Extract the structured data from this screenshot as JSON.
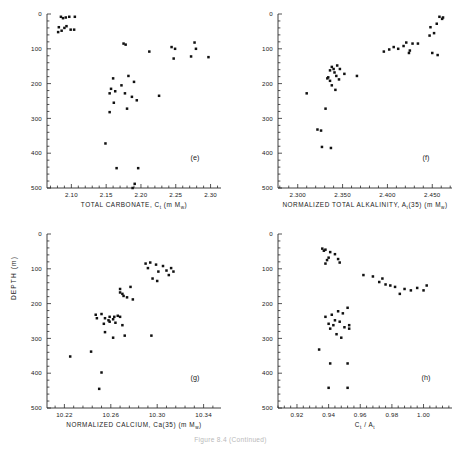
{
  "figure": {
    "caption": "Figure 8.4 (Continued)",
    "y_axis_label": "DEPTH (m)",
    "y_ticks": [
      0,
      100,
      200,
      300,
      400,
      500
    ],
    "y_range": [
      0,
      500
    ],
    "y_inverted": true,
    "marker": "filled-square",
    "marker_color": "#111111",
    "axis_color": "#2a2a2a",
    "background": "#ffffff"
  },
  "chart_data": [
    {
      "type": "scatter",
      "panel": "(e)",
      "title": "",
      "xlabel": "TOTAL CARBONATE, C",
      "xlabel_sub": "t",
      "xlabel_units": "(m M",
      "xlabel_units_sub": "w",
      "xlabel_units_end": ")",
      "xlabel_full": "TOTAL CARBONATE, Ct (m Mw)",
      "ylabel": "DEPTH (m)",
      "xlim": [
        2.065,
        2.315
      ],
      "ylim": [
        0,
        500
      ],
      "xticks": [
        2.1,
        2.15,
        2.2,
        2.25,
        2.3
      ],
      "xticklabels": [
        "2.10",
        "2.15",
        "2.20",
        "2.25",
        "2.30"
      ],
      "yticks": [
        0,
        100,
        200,
        300,
        400,
        500
      ],
      "grid": false,
      "x": [
        2.085,
        2.088,
        2.092,
        2.097,
        2.105,
        2.082,
        2.09,
        2.093,
        2.099,
        2.086,
        2.081,
        2.104,
        2.175,
        2.178,
        2.212,
        2.244,
        2.277,
        2.249,
        2.279,
        2.247,
        2.272,
        2.297,
        2.16,
        2.157,
        2.155,
        2.163,
        2.182,
        2.19,
        2.172,
        2.177,
        2.226,
        2.161,
        2.187,
        2.194,
        2.18,
        2.155,
        2.149,
        2.165,
        2.196,
        2.191,
        2.188
      ],
      "y": [
        8,
        12,
        10,
        8,
        8,
        38,
        40,
        35,
        45,
        48,
        52,
        45,
        85,
        88,
        108,
        95,
        82,
        100,
        100,
        128,
        122,
        124,
        185,
        215,
        228,
        222,
        178,
        195,
        205,
        228,
        235,
        255,
        238,
        248,
        272,
        282,
        372,
        443,
        443,
        488,
        500
      ],
      "n_points": 41
    },
    {
      "type": "scatter",
      "panel": "(f)",
      "title": "",
      "xlabel_full": "NORMALIZED TOTAL ALKALINITY, At(35) (m Mw)",
      "ylabel": "DEPTH (m)",
      "xlim": [
        2.278,
        2.472
      ],
      "ylim": [
        0,
        500
      ],
      "xticks": [
        2.3,
        2.35,
        2.4,
        2.45
      ],
      "xticklabels": [
        "2.300",
        "2.350",
        "2.400",
        "2.450"
      ],
      "yticks": [
        0,
        100,
        200,
        300,
        400,
        500
      ],
      "grid": false,
      "x": [
        2.458,
        2.462,
        2.461,
        2.455,
        2.448,
        2.452,
        2.447,
        2.421,
        2.428,
        2.434,
        2.418,
        2.407,
        2.412,
        2.402,
        2.425,
        2.424,
        2.396,
        2.45,
        2.456,
        2.344,
        2.338,
        2.34,
        2.336,
        2.347,
        2.341,
        2.343,
        2.334,
        2.333,
        2.336,
        2.346,
        2.352,
        2.338,
        2.342,
        2.366,
        2.31,
        2.331,
        2.322,
        2.326,
        2.327,
        2.337
      ],
      "y": [
        8,
        10,
        14,
        28,
        38,
        55,
        62,
        82,
        85,
        85,
        92,
        95,
        100,
        102,
        105,
        112,
        108,
        112,
        118,
        148,
        152,
        158,
        162,
        158,
        168,
        178,
        182,
        185,
        192,
        188,
        172,
        205,
        218,
        178,
        228,
        272,
        332,
        335,
        382,
        385
      ],
      "n_points": 40
    },
    {
      "type": "scatter",
      "panel": "(g)",
      "title": "",
      "xlabel_full": "NORMALIZED CALCIUM, Ca(35) (m Mw)",
      "ylabel": "DEPTH (m)",
      "xlim": [
        10.205,
        10.355
      ],
      "ylim": [
        0,
        500
      ],
      "xticks": [
        10.22,
        10.26,
        10.3,
        10.34
      ],
      "xticklabels": [
        "10.22",
        "10.26",
        "10.30",
        "10.34"
      ],
      "yticks": [
        0,
        100,
        200,
        300,
        400,
        500
      ],
      "grid": false,
      "x": [
        10.29,
        10.294,
        10.299,
        10.305,
        10.312,
        10.292,
        10.301,
        10.308,
        10.314,
        10.31,
        10.296,
        10.3,
        10.268,
        10.268,
        10.27,
        10.271,
        10.277,
        10.274,
        10.279,
        10.247,
        10.252,
        10.248,
        10.259,
        10.263,
        10.266,
        10.255,
        10.258,
        10.262,
        10.268,
        10.254,
        10.259,
        10.264,
        10.27,
        10.255,
        10.262,
        10.272,
        10.295,
        10.243,
        10.225,
        10.252,
        10.25
      ],
      "y": [
        85,
        82,
        88,
        92,
        98,
        98,
        108,
        105,
        108,
        118,
        128,
        135,
        158,
        168,
        172,
        178,
        152,
        182,
        188,
        232,
        230,
        242,
        238,
        238,
        235,
        242,
        248,
        245,
        238,
        258,
        252,
        255,
        262,
        282,
        298,
        292,
        292,
        338,
        352,
        398,
        445
      ],
      "n_points": 41
    },
    {
      "type": "scatter",
      "panel": "(h)",
      "title": "",
      "xlabel_full": "Ct / At",
      "ylabel": "DEPTH (m)",
      "xlim": [
        0.908,
        1.018
      ],
      "ylim": [
        0,
        500
      ],
      "xticks": [
        0.92,
        0.94,
        0.96,
        0.98,
        1.0
      ],
      "xticklabels": [
        "0.92",
        "0.94",
        "0.96",
        "0.98",
        "1.00"
      ],
      "yticks": [
        0,
        100,
        200,
        300,
        400,
        500
      ],
      "grid": false,
      "x": [
        0.936,
        0.938,
        0.937,
        0.941,
        0.944,
        0.94,
        0.939,
        0.946,
        0.947,
        0.938,
        0.962,
        0.968,
        0.974,
        0.972,
        0.979,
        0.982,
        0.988,
        0.992,
        0.996,
        1.002,
        1.0,
        0.985,
        0.976,
        0.938,
        0.942,
        0.946,
        0.944,
        0.949,
        0.952,
        0.94,
        0.943,
        0.947,
        0.941,
        0.95,
        0.953,
        0.953,
        0.945,
        0.948,
        0.934,
        0.941,
        0.952,
        0.94,
        0.952
      ],
      "y": [
        42,
        45,
        48,
        52,
        58,
        68,
        75,
        72,
        82,
        85,
        118,
        122,
        128,
        138,
        148,
        152,
        158,
        162,
        155,
        148,
        162,
        172,
        145,
        238,
        232,
        222,
        248,
        228,
        212,
        258,
        262,
        252,
        272,
        268,
        262,
        272,
        288,
        298,
        332,
        372,
        372,
        442,
        442
      ],
      "n_points": 43
    }
  ]
}
